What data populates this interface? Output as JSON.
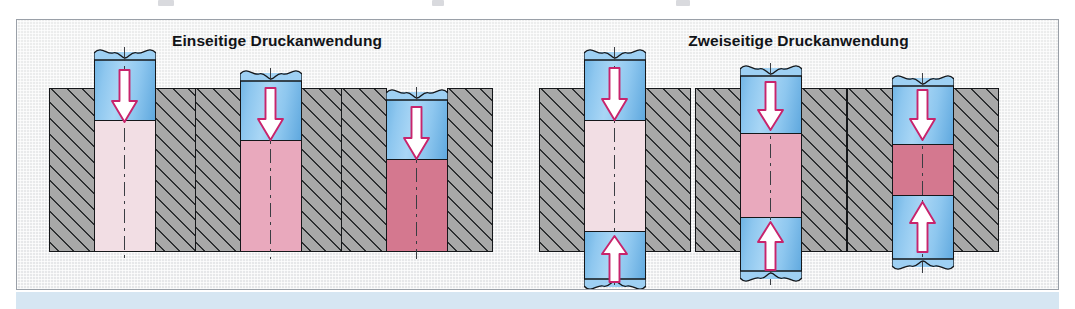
{
  "figure": {
    "background_color": "#ffffff",
    "panel_bg_color": "#e9eaec",
    "panel_border_color": "#9aa0a8",
    "bottom_band_color": "#d6e6f2"
  },
  "groups": [
    {
      "id": "einseitig",
      "title": "Einseitige Druckanwendung",
      "stages": [
        {
          "name": "stage-1",
          "material_color": "#f2dee4",
          "material_label": "loses Pulver",
          "upper_punch": true,
          "lower_punch": false,
          "arrow_down": true,
          "arrow_up": false
        },
        {
          "name": "stage-2",
          "material_color": "#e9a9bd",
          "material_label": "teilverdichtet",
          "upper_punch": true,
          "lower_punch": false,
          "arrow_down": true,
          "arrow_up": false
        },
        {
          "name": "stage-3",
          "material_color": "#d4788f",
          "material_label": "verdichtet",
          "upper_punch": true,
          "lower_punch": false,
          "arrow_down": true,
          "arrow_up": false
        }
      ]
    },
    {
      "id": "zweiseitig",
      "title": "Zweiseitige Druckanwendung",
      "stages": [
        {
          "name": "stage-1",
          "material_color": "#f2dee4",
          "material_label": "loses Pulver",
          "upper_punch": true,
          "lower_punch": true,
          "arrow_down": true,
          "arrow_up": true
        },
        {
          "name": "stage-2",
          "material_color": "#e9a9bd",
          "material_label": "teilverdichtet",
          "upper_punch": true,
          "lower_punch": true,
          "arrow_down": true,
          "arrow_up": true
        },
        {
          "name": "stage-3",
          "material_color": "#d4788f",
          "material_label": "verdichtet",
          "upper_punch": true,
          "lower_punch": true,
          "arrow_down": true,
          "arrow_up": true
        }
      ]
    }
  ],
  "legend_colors": {
    "punch": "#8ec7ef",
    "die": "#a8a8a8",
    "arrow_fill": "#ffffff",
    "arrow_outline": "#c8246c",
    "outline": "#15171a"
  }
}
